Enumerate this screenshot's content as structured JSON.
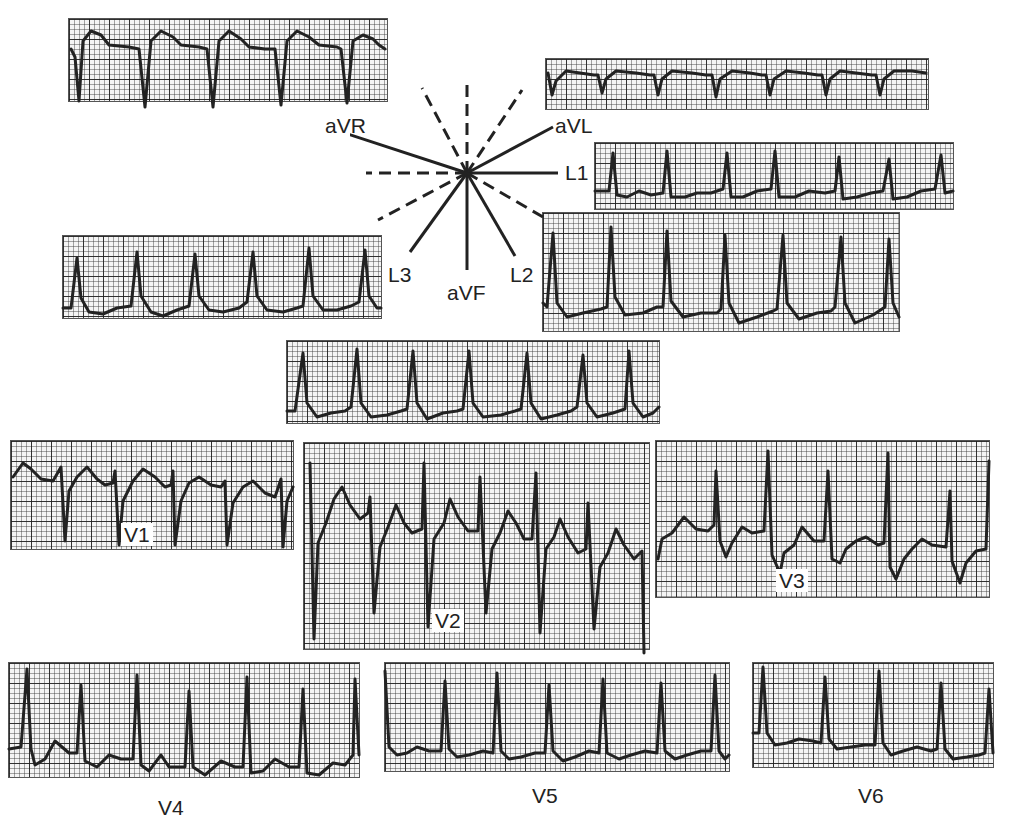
{
  "figure": {
    "title": "",
    "grid": {
      "major_px": 20,
      "minor_px": 5,
      "line_color": "#1e1e1e",
      "paper_color": "#f4f4f4"
    },
    "trace_color": "#222222"
  },
  "hexaxial": {
    "center": [
      467,
      173
    ],
    "solid_axes": [
      {
        "label": "aVR",
        "angle_deg": -150
      },
      {
        "label": "aVL",
        "angle_deg": -30
      },
      {
        "label": "L1",
        "angle_deg": 0
      },
      {
        "label": "L2",
        "angle_deg": 60
      },
      {
        "label": "aVF",
        "angle_deg": 90
      },
      {
        "label": "L3",
        "angle_deg": 120
      }
    ],
    "dashed_axes_deg": [
      -120,
      -90,
      -60,
      150,
      180,
      30
    ],
    "labels": {
      "aVR": "aVR",
      "aVL": "aVL",
      "L1": "L1",
      "L2": "L2",
      "L3": "L3",
      "aVF": "aVF"
    }
  },
  "leads": [
    {
      "id": "aVR",
      "label": "",
      "box": [
        68,
        18,
        318,
        82
      ],
      "morphology": "negative QS complexes with upright T",
      "beats": 6
    },
    {
      "id": "aVL",
      "label": "",
      "box": [
        545,
        58,
        382,
        50
      ],
      "morphology": "small negative complexes",
      "beats": 7
    },
    {
      "id": "L1",
      "label": "",
      "box": [
        594,
        142,
        358,
        66
      ],
      "morphology": "narrow R with ST depression",
      "beats": 7
    },
    {
      "id": "L3",
      "label": "",
      "box": [
        62,
        235,
        318,
        82
      ],
      "morphology": "tall R with ST depression",
      "beats": 6
    },
    {
      "id": "L2",
      "label": "",
      "box": [
        542,
        212,
        356,
        118
      ],
      "morphology": "tall R with marked ST depression",
      "beats": 6
    },
    {
      "id": "aVF",
      "label": "",
      "box": [
        286,
        340,
        372,
        82
      ],
      "morphology": "tall R with ST depression",
      "beats": 7
    },
    {
      "id": "V1",
      "label": "V1",
      "box": [
        10,
        440,
        282,
        108
      ],
      "morphology": "deep S with elevated ST/T",
      "beats": 5
    },
    {
      "id": "V2",
      "label": "V2",
      "box": [
        303,
        442,
        345,
        206
      ],
      "morphology": "deep S with elevated ST/T",
      "beats": 6
    },
    {
      "id": "V3",
      "label": "V3",
      "box": [
        655,
        440,
        333,
        156
      ],
      "morphology": "RS with elevated ST",
      "beats": 6
    },
    {
      "id": "V4",
      "label": "V4",
      "box": [
        8,
        662,
        350,
        114
      ],
      "morphology": "tall R with ST depression",
      "beats": 7
    },
    {
      "id": "V5",
      "label": "V5",
      "box": [
        384,
        662,
        344,
        108
      ],
      "morphology": "tall R with ST depression",
      "beats": 7
    },
    {
      "id": "V6",
      "label": "V6",
      "box": [
        752,
        662,
        240,
        104
      ],
      "morphology": "R with ST depression",
      "beats": 5
    }
  ],
  "lead_labels": {
    "V1": "V1",
    "V2": "V2",
    "V3": "V3",
    "V4": "V4",
    "V5": "V5",
    "V6": "V6"
  }
}
